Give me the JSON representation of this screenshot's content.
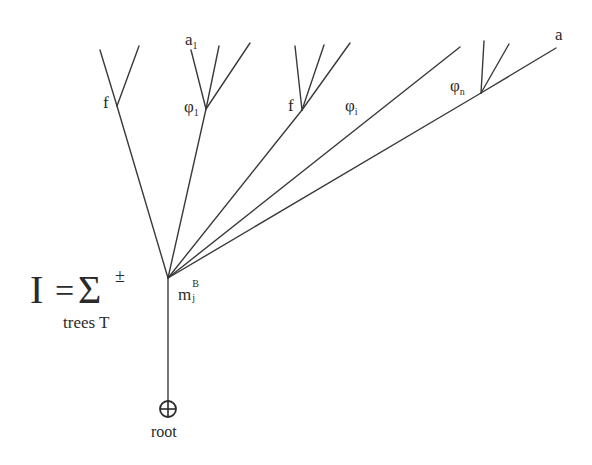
{
  "diagram": {
    "type": "tree",
    "formula": {
      "lhs": "I",
      "equals": "=",
      "sum": "Σ",
      "sign": "±",
      "subscript": "trees T"
    },
    "labels": {
      "f_left": "f",
      "a1_base": "a",
      "a1_sub": "1",
      "phi1_base": "φ",
      "phi1_sub": "1",
      "f_mid": "f",
      "phii_base": "φ",
      "phii_sub": "i",
      "phin_base": "φ",
      "phin_sub": "n",
      "a_right": "a",
      "vertex_base": "m",
      "vertex_sub": "j",
      "vertex_sup": "B",
      "root_symbol": "⊕",
      "root": "root"
    },
    "nodes": {
      "root": [
        168,
        409
      ],
      "vertex": [
        168,
        278
      ],
      "f_left": [
        117,
        106
      ],
      "phi_1": [
        206,
        109
      ],
      "f_mid": [
        302,
        110
      ],
      "phi_n": [
        481,
        93
      ]
    },
    "colors": {
      "line": "#3a3a3a",
      "text": "#2a2a2a",
      "background": "#ffffff"
    }
  }
}
